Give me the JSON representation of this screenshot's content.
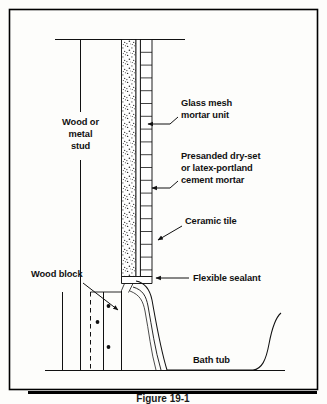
{
  "figure": {
    "kind": "construction-section-diagram",
    "background_color": "#fdfdfb",
    "line_color": "#111111",
    "border": {
      "present": true,
      "color": "#000000"
    },
    "caption": "Figure 19-1"
  },
  "labels": {
    "stud": {
      "line1": "Wood or",
      "line2": "metal",
      "line3": "stud"
    },
    "glass_mesh": {
      "line1": "Glass mesh",
      "line2": "mortar unit"
    },
    "mortar": {
      "line1": "Presanded dry-set",
      "line2": "or latex-portland",
      "line3": "cement mortar"
    },
    "ceramic_tile": "Ceramic tile",
    "flexible_sealant": "Flexible sealant",
    "wood_block": "Wood block",
    "bath_tub": "Bath tub"
  },
  "layers": [
    {
      "name": "wood-or-metal-stud",
      "role": "framing"
    },
    {
      "name": "glass-mesh-mortar-unit",
      "role": "backer-board",
      "pattern": "stipple"
    },
    {
      "name": "presanded-dry-set-or-latex-portland-cement-mortar",
      "role": "bond-coat"
    },
    {
      "name": "ceramic-tile",
      "role": "finish",
      "pattern": "coursed-horizontal-joints"
    },
    {
      "name": "flexible-sealant",
      "role": "joint-seal"
    },
    {
      "name": "wood-block",
      "role": "blocking",
      "edge": "dashed"
    },
    {
      "name": "bath-tub",
      "role": "fixture"
    }
  ],
  "fasteners": {
    "count": 3,
    "symbol": "dot"
  }
}
